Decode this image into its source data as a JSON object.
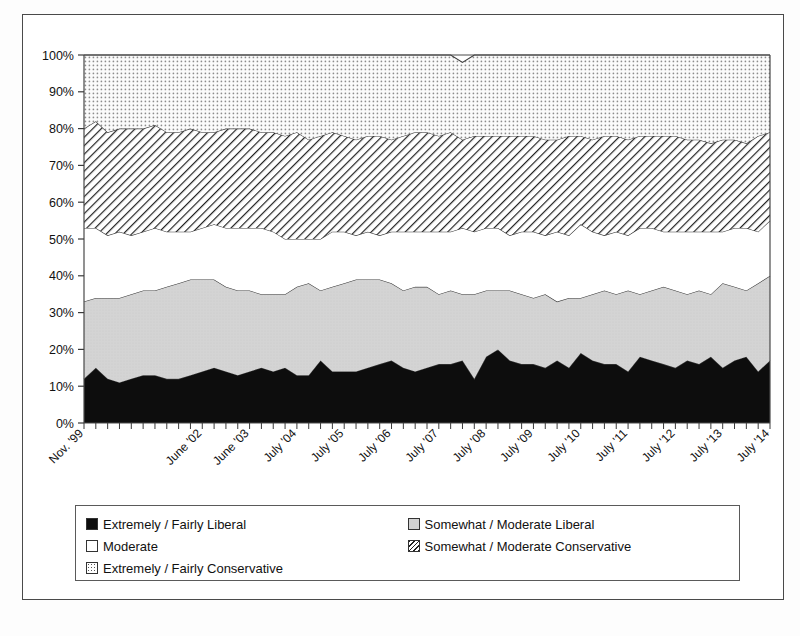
{
  "chart_data": {
    "type": "area",
    "stacked": true,
    "title": "",
    "xlabel": "",
    "ylabel": "",
    "ylim": [
      0,
      100
    ],
    "ytick_labels": [
      "0%",
      "10%",
      "20%",
      "30%",
      "40%",
      "50%",
      "60%",
      "70%",
      "80%",
      "90%",
      "100%"
    ],
    "ytick_values": [
      0,
      10,
      20,
      30,
      40,
      50,
      60,
      70,
      80,
      90,
      100
    ],
    "grid": false,
    "legend_position": "bottom",
    "x_tick_label_rotation": -45,
    "categories": [
      "Nov. '99",
      "",
      "",
      "",
      "",
      "",
      "",
      "",
      "",
      "",
      "June '02",
      "",
      "",
      "",
      "June '03",
      "",
      "",
      "",
      "July '04",
      "",
      "",
      "",
      "July '05",
      "",
      "",
      "",
      "July '06",
      "",
      "",
      "",
      "July '07",
      "",
      "",
      "",
      "July '08",
      "",
      "",
      "",
      "July '09",
      "",
      "",
      "",
      "July '10",
      "",
      "",
      "",
      "July '11",
      "",
      "",
      "",
      "July '12",
      "",
      "",
      "",
      "July '13",
      "",
      "",
      "",
      "July '14"
    ],
    "labeled_ticks": [
      "Nov. '99",
      "June '02",
      "June '03",
      "July '04",
      "July '05",
      "July '06",
      "July '07",
      "July '08",
      "July '09",
      "July '10",
      "July '11",
      "July '12",
      "July '13",
      "July '14"
    ],
    "series": [
      {
        "name": "Extremely / Fairly Liberal",
        "fill": "black",
        "color": "#0d0d0d",
        "values": [
          12,
          15,
          12,
          11,
          12,
          13,
          13,
          12,
          12,
          13,
          14,
          15,
          14,
          13,
          14,
          15,
          14,
          15,
          13,
          13,
          17,
          14,
          14,
          14,
          15,
          16,
          17,
          15,
          14,
          15,
          16,
          16,
          17,
          12,
          18,
          20,
          17,
          16,
          16,
          15,
          17,
          15,
          19,
          17,
          16,
          16,
          14,
          18,
          17,
          16,
          15,
          17,
          16,
          18,
          15,
          17,
          18,
          14,
          17
        ]
      },
      {
        "name": "Somewhat / Moderate Liberal",
        "fill": "lightgray",
        "color": "#d2d2d2",
        "values": [
          21,
          19,
          22,
          23,
          23,
          23,
          23,
          25,
          26,
          26,
          25,
          24,
          23,
          23,
          22,
          20,
          21,
          20,
          24,
          25,
          19,
          23,
          24,
          25,
          24,
          23,
          21,
          21,
          23,
          22,
          19,
          20,
          18,
          23,
          18,
          16,
          19,
          19,
          18,
          20,
          16,
          19,
          15,
          18,
          20,
          19,
          22,
          17,
          19,
          21,
          21,
          18,
          20,
          17,
          23,
          20,
          18,
          24,
          23
        ]
      },
      {
        "name": "Moderate",
        "fill": "white",
        "color": "#ffffff",
        "values": [
          20,
          19,
          17,
          18,
          16,
          16,
          17,
          15,
          14,
          13,
          14,
          15,
          16,
          17,
          17,
          18,
          17,
          15,
          13,
          12,
          14,
          15,
          14,
          12,
          13,
          12,
          14,
          16,
          15,
          15,
          17,
          16,
          18,
          17,
          17,
          17,
          15,
          17,
          18,
          16,
          19,
          17,
          20,
          17,
          15,
          17,
          15,
          18,
          17,
          15,
          16,
          17,
          16,
          17,
          14,
          16,
          17,
          14,
          15
        ]
      },
      {
        "name": "Somewhat / Moderate Conservative",
        "fill": "diagonal-hatch",
        "color": "#ffffff",
        "values": [
          27,
          29,
          28,
          28,
          29,
          28,
          28,
          27,
          27,
          28,
          26,
          25,
          27,
          27,
          27,
          26,
          27,
          28,
          29,
          27,
          28,
          27,
          26,
          26,
          26,
          27,
          25,
          26,
          27,
          27,
          26,
          27,
          24,
          26,
          25,
          25,
          27,
          26,
          26,
          26,
          25,
          27,
          24,
          25,
          27,
          26,
          26,
          25,
          25,
          26,
          26,
          25,
          25,
          24,
          25,
          24,
          23,
          26,
          24
        ]
      },
      {
        "name": "Extremely / Fairly Conservative",
        "fill": "dotted",
        "color": "#ffffff",
        "values": [
          20,
          18,
          21,
          20,
          20,
          20,
          19,
          21,
          21,
          20,
          21,
          21,
          20,
          20,
          20,
          21,
          21,
          22,
          21,
          23,
          22,
          21,
          22,
          23,
          22,
          22,
          23,
          22,
          21,
          21,
          22,
          21,
          21,
          22,
          22,
          22,
          22,
          22,
          22,
          23,
          23,
          22,
          22,
          23,
          22,
          22,
          23,
          22,
          22,
          22,
          22,
          23,
          23,
          24,
          23,
          23,
          24,
          22,
          21
        ]
      }
    ]
  },
  "legend": {
    "entries": [
      {
        "label": "Extremely / Fairly Liberal",
        "swatch": "sw-black"
      },
      {
        "label": "Somewhat / Moderate Liberal",
        "swatch": "sw-gray"
      },
      {
        "label": "Moderate",
        "swatch": "sw-white"
      },
      {
        "label": "Somewhat / Moderate Conservative",
        "swatch": "sw-hatch"
      },
      {
        "label": "Extremely / Fairly Conservative",
        "swatch": "sw-dots"
      }
    ]
  }
}
